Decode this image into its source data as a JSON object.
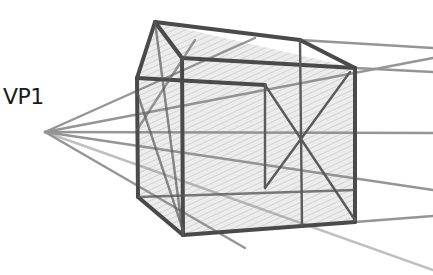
{
  "diagram": {
    "type": "perspective-sketch",
    "vanishing_point_label": "VP1",
    "colors": {
      "construction_line": "#8a8a8a",
      "cube_edge": "#4a4a4a",
      "shading": "#c8c8c8",
      "label": "#1a1a1a"
    },
    "vanishing_point": {
      "x": 45,
      "y": 132
    }
  }
}
